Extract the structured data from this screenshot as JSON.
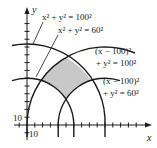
{
  "figure": {
    "axes": {
      "x_label": "x",
      "y_label": "y",
      "x_tick_label": "10",
      "y_tick_label": "10",
      "origin_px": [
        27,
        125
      ],
      "scale_px_per_unit": 0.78,
      "tick_spacing_units": 10
    },
    "circles": [
      {
        "name": "circle-origin-r100",
        "cx": 0,
        "cy": 0,
        "r": 100,
        "label_line1": "x² + y² = 100²"
      },
      {
        "name": "circle-origin-r60",
        "cx": 0,
        "cy": 0,
        "r": 60,
        "label_line1": "x² + y² = 60²"
      },
      {
        "name": "circle-100-r100",
        "cx": 100,
        "cy": 0,
        "r": 100,
        "label_line1": "(x − 100)²",
        "label_line2": "+ y² = 100²"
      },
      {
        "name": "circle-100-r60",
        "cx": 100,
        "cy": 0,
        "r": 60,
        "label_line1": "(x − 100)²",
        "label_line2": "+ y² = 60²"
      }
    ],
    "shaded_region": {
      "description": "Region where 60 ≤ distance from (0,0) ≤ 100 and 60 ≤ distance from (100,0) ≤ 100",
      "color": "#c8c8c8"
    },
    "colors": {
      "stroke": "#1a1a1a",
      "shade": "#c8c8c8"
    }
  }
}
